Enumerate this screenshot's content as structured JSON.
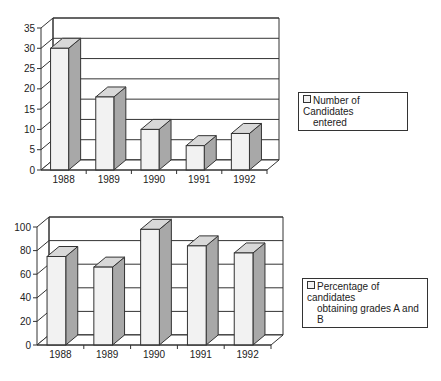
{
  "chart_data": [
    {
      "type": "bar",
      "title": "",
      "xlabel": "",
      "ylabel": "",
      "categories": [
        "1988",
        "1989",
        "1990",
        "1991",
        "1992"
      ],
      "series": [
        {
          "name": "Number of Candidates entered",
          "values": [
            30,
            18,
            10,
            6,
            9
          ]
        }
      ],
      "ylim": [
        0,
        35
      ],
      "yticks": [
        0,
        5,
        10,
        15,
        20,
        25,
        30,
        35
      ],
      "grid": true,
      "legend_position": "right",
      "style": "3d"
    },
    {
      "type": "bar",
      "title": "",
      "xlabel": "",
      "ylabel": "",
      "categories": [
        "1988",
        "1989",
        "1990",
        "1991",
        "1992"
      ],
      "series": [
        {
          "name": "Percentage of candidates obtaining grades A and B",
          "values": [
            75,
            66,
            98,
            84,
            78
          ]
        }
      ],
      "ylim": [
        0,
        100
      ],
      "yticks": [
        0,
        20,
        40,
        60,
        80,
        100
      ],
      "grid": true,
      "legend_position": "right",
      "style": "3d"
    }
  ],
  "legends": {
    "top": {
      "line1": "Number of Candidates",
      "line2": "entered"
    },
    "bottom": {
      "line1": "Percentage of candidates",
      "line2": "obtaining grades A and B"
    }
  },
  "colors": {
    "bar_front": "#f2f2f2",
    "bar_side": "#a8a8a8",
    "bar_top": "#d8d8d8",
    "line": "#333333"
  }
}
